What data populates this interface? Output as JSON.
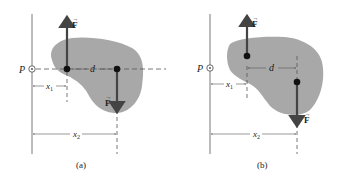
{
  "colors": {
    "blob": "#a8a8a8",
    "line": "#555555",
    "arrow": "#444444",
    "text": "#222222"
  },
  "panels": [
    {
      "id": "a",
      "caption": "(a)",
      "point_label": "P",
      "force_up_label": "F",
      "force_down_label": "F",
      "distance_d_label": "d",
      "x1_label": "x",
      "x1_sub": "1",
      "x2_label": "x",
      "x2_sub": "2"
    },
    {
      "id": "b",
      "caption": "(b)",
      "point_label": "P",
      "force_up_label": "F",
      "force_down_label": "F",
      "distance_d_label": "d",
      "x1_label": "x",
      "x1_sub": "1",
      "x2_label": "x",
      "x2_sub": "2"
    }
  ]
}
